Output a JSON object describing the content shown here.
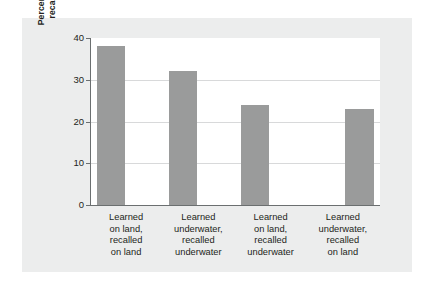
{
  "chart_data": {
    "type": "bar",
    "title": "",
    "subtitle": "",
    "xlabel": "",
    "ylabel": "Percentage of words recalled correctly",
    "ylabel_lines": [
      "Percentage of words",
      "recalled correctly"
    ],
    "categories": [
      "Learned on land, recalled on land",
      "Learned underwater, recalled underwater",
      "Learned on land, recalled underwater",
      "Learned underwater, recalled on land"
    ],
    "category_lines": [
      [
        "Learned",
        "on land,",
        "recalled",
        "on land"
      ],
      [
        "Learned",
        "underwater,",
        "recalled",
        "underwater"
      ],
      [
        "Learned",
        "on land,",
        "recalled",
        "underwater"
      ],
      [
        "Learned",
        "underwater,",
        "recalled",
        "on land"
      ]
    ],
    "values": [
      38,
      32,
      24,
      23
    ],
    "ylim": [
      0,
      40
    ],
    "yticks": [
      0,
      10,
      20,
      30,
      40
    ],
    "ytick_labels": [
      "0",
      "10",
      "20",
      "30",
      "40"
    ],
    "grid": true,
    "grid_axis": "y",
    "legend": "none",
    "bar_color": "#9a9b9b",
    "plot_background": "#ffffff",
    "panel_background": "#eceded",
    "axis_color": "#6b6f70",
    "gridline_color": "#d8d9da",
    "text_color": "#231f20"
  }
}
